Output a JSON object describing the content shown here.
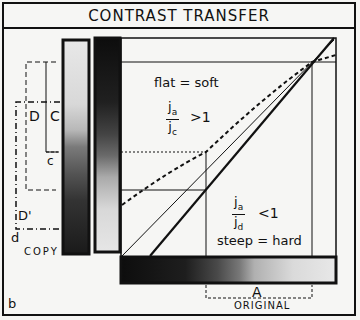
{
  "title": "CONTRAST TRANSFER",
  "panel_label": "b",
  "labels": {
    "copy": "COPY",
    "original": "ORIGINAL",
    "A": "A",
    "C": "C",
    "c": "c",
    "D": "D",
    "D_prime": "D'",
    "d": "d",
    "flat": "flat = soft",
    "steep": "steep = hard",
    "ratio1_num": "j",
    "ratio1_num_sub": "a",
    "ratio1_den": "j",
    "ratio1_den_sub": "c",
    "ratio1_rel": ">1",
    "ratio2_num": "j",
    "ratio2_num_sub": "a",
    "ratio2_den": "j",
    "ratio2_den_sub": "d",
    "ratio2_rel": "<1"
  },
  "colors": {
    "ink": "#111111",
    "paper": "#f6f6f4"
  }
}
